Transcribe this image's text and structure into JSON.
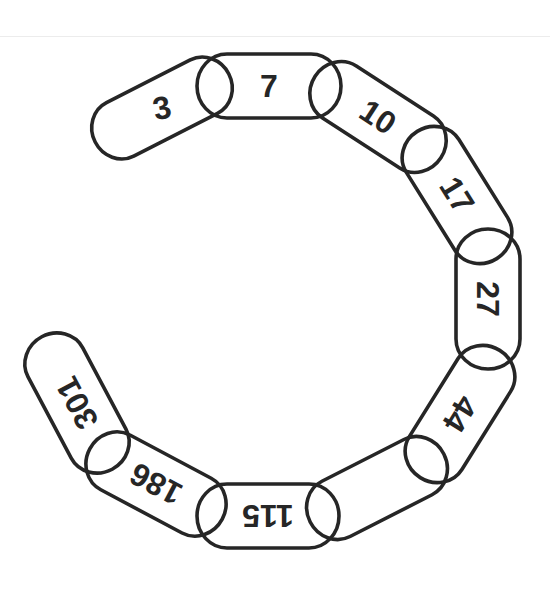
{
  "diagram": {
    "sequence": [
      "3",
      "7",
      "10",
      "17",
      "27",
      "44",
      "",
      "115",
      "186",
      "301"
    ],
    "stroke_color": "#262626",
    "background": "#ffffff",
    "links": [
      {
        "label": "3",
        "cx": 162,
        "cy": 108,
        "w": 150,
        "h": 60,
        "angle": -27,
        "text_angle": -12
      },
      {
        "label": "7",
        "cx": 269,
        "cy": 86,
        "w": 144,
        "h": 64,
        "angle": 0,
        "text_angle": 0
      },
      {
        "label": "10",
        "cx": 378,
        "cy": 117,
        "w": 150,
        "h": 62,
        "angle": 33,
        "text_angle": 33
      },
      {
        "label": "17",
        "cx": 457,
        "cy": 195,
        "w": 150,
        "h": 62,
        "angle": 58,
        "text_angle": 58
      },
      {
        "label": "27",
        "cx": 488,
        "cy": 299,
        "w": 140,
        "h": 64,
        "angle": 90,
        "text_angle": 90
      },
      {
        "label": "44",
        "cx": 460,
        "cy": 414,
        "w": 150,
        "h": 62,
        "angle": 122,
        "text_angle": 122
      },
      {
        "label": "",
        "cx": 377,
        "cy": 488,
        "w": 150,
        "h": 62,
        "angle": 153,
        "text_angle": 153
      },
      {
        "label": "115",
        "cx": 268,
        "cy": 516,
        "w": 142,
        "h": 64,
        "angle": 180,
        "text_angle": 180
      },
      {
        "label": "186",
        "cx": 156,
        "cy": 484,
        "w": 150,
        "h": 62,
        "angle": 208,
        "text_angle": 208
      },
      {
        "label": "301",
        "cx": 77,
        "cy": 403,
        "w": 150,
        "h": 62,
        "angle": 242,
        "text_angle": 242
      }
    ]
  }
}
